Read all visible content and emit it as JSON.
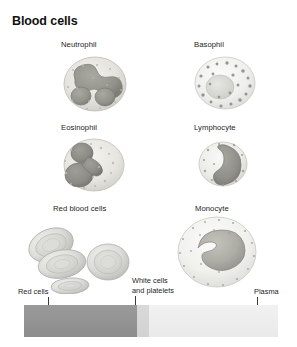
{
  "figure": {
    "title": "Blood cells",
    "background_color": "#ffffff"
  },
  "cells": [
    {
      "name": "neutrophil",
      "label": "Neutrophil",
      "column": "left",
      "row": 1
    },
    {
      "name": "basophil",
      "label": "Basophil",
      "column": "right",
      "row": 1
    },
    {
      "name": "eosinophil",
      "label": "Eosinophil",
      "column": "left",
      "row": 2
    },
    {
      "name": "lymphocyte",
      "label": "Lymphocyte",
      "column": "right",
      "row": 2
    },
    {
      "name": "red-blood-cells",
      "label": "Red blood cells",
      "column": "left",
      "row": 3
    },
    {
      "name": "monocyte",
      "label": "Monocyte",
      "column": "right",
      "row": 3
    }
  ],
  "fraction_bar": {
    "segments": [
      {
        "name": "red-cells",
        "label": "Red cells",
        "color": "#949494"
      },
      {
        "name": "white-cells",
        "label": "White cells\nand platelets",
        "color": "#d4d4d4"
      },
      {
        "name": "plasma",
        "label": "Plasma",
        "color": "#eeeeee"
      }
    ],
    "labels": {
      "red_cells": "Red cells",
      "white_cells_line1": "White cells",
      "white_cells_line2": "and platelets",
      "plasma": "Plasma"
    }
  }
}
